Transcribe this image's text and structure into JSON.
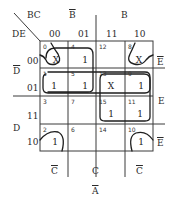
{
  "kmap": {
    "corner": {
      "top": "BC",
      "left": "DE"
    },
    "col_headers": [
      "00",
      "01",
      "11",
      "10"
    ],
    "row_headers": [
      "00",
      "01",
      "11",
      "10"
    ],
    "top_groups": [
      {
        "label": "B",
        "bar": true
      },
      {
        "label": "B",
        "bar": false
      }
    ],
    "left_groups": [
      {
        "label": "D",
        "bar": true
      },
      {
        "label": "D",
        "bar": false
      }
    ],
    "right_labels": [
      {
        "label": "E",
        "bar": true
      },
      {
        "label": "E",
        "bar": false
      },
      {
        "label": "E",
        "bar": true
      }
    ],
    "bottom_labels": [
      {
        "label": "C",
        "bar": true
      },
      {
        "label": "C",
        "bar": false
      },
      {
        "label": "C",
        "bar": true
      }
    ],
    "footer": {
      "label": "A",
      "bar": true
    },
    "cells": [
      [
        {
          "index": "0",
          "value": "X"
        },
        {
          "index": "4",
          "value": "1"
        },
        {
          "index": "12",
          "value": ""
        },
        {
          "index": "8",
          "value": "X"
        }
      ],
      [
        {
          "index": "1",
          "value": "1"
        },
        {
          "index": "5",
          "value": "1"
        },
        {
          "index": "13",
          "value": "X"
        },
        {
          "index": "9",
          "value": "1"
        }
      ],
      [
        {
          "index": "3",
          "value": ""
        },
        {
          "index": "7",
          "value": ""
        },
        {
          "index": "15",
          "value": "1"
        },
        {
          "index": "11",
          "value": "1"
        }
      ],
      [
        {
          "index": "2",
          "value": "1"
        },
        {
          "index": "6",
          "value": ""
        },
        {
          "index": "14",
          "value": ""
        },
        {
          "index": "10",
          "value": "1"
        }
      ]
    ],
    "groupings": [
      "corner group: cells 0, 8, 2, 10",
      "cells 0, 4, 1, 5",
      "cells 1, 5, 13, 9",
      "cells 13, 9, 15, 11"
    ]
  }
}
